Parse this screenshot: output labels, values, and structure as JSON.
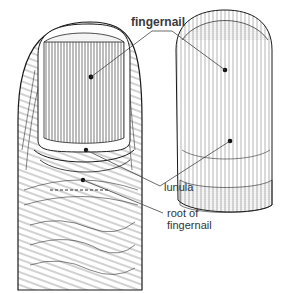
{
  "labels": {
    "fingernail": "fingernail",
    "lunula": "lunula",
    "root_line1": "root of",
    "root_line2": "fingernail"
  },
  "colors": {
    "ink": "#1a1a1a",
    "label": "#333333",
    "background": "#ffffff"
  }
}
